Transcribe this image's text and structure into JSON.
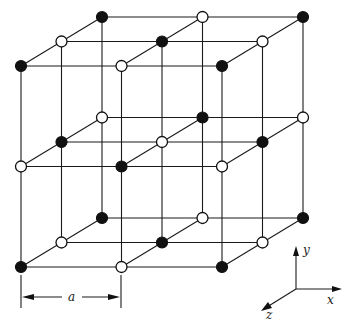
{
  "diagram": {
    "title": "",
    "type": "crystal-lattice",
    "colors": {
      "line": "#1a1a1a",
      "filled_ion": "#111111",
      "open_ion": "#ffffff",
      "background": "#ffffff"
    },
    "lattice": {
      "size": [
        3,
        3,
        3
      ],
      "origin_front_top_left": [
        21,
        66
      ],
      "step_x": [
        100.5,
        0
      ],
      "step_y": [
        0,
        100.5
      ],
      "step_back": [
        40.5,
        -24.5
      ],
      "ion_radius": 5.5,
      "pattern": "filled when (i+j+k) even; i=x index, j=row index from top, k=depth index from front"
    },
    "dimension": {
      "label": "a",
      "from_x": 21,
      "to_x": 121,
      "y": 297
    },
    "axes": {
      "origin": [
        296,
        289
      ],
      "labels": {
        "x": "x",
        "y": "y",
        "z": "z"
      }
    }
  }
}
